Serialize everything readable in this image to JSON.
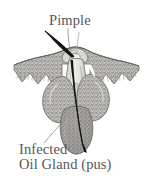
{
  "figure": {
    "type": "anatomical-cross-section",
    "background_color": "#ffffff",
    "labels": {
      "pimple": "Pimple",
      "infected": "Infected",
      "oil_gland": "Oil Gland (pus)"
    },
    "label_color": "#565656",
    "parts": [
      {
        "name": "skin-layer",
        "description": "Stippled epidermis band spanning the width with a scalloped lower edge",
        "fill_color": "#b4b4b4",
        "stroke_color": "#6f6f6f"
      },
      {
        "name": "hair-shaft",
        "description": "Dark hair emerging from pore, angled up-left above skin",
        "fill_color": "#1c1c1c"
      },
      {
        "name": "hair-root",
        "description": "Dark hair root descending through follicle into the infected gland",
        "fill_color": "#1c1c1c"
      },
      {
        "name": "follicle-duct",
        "description": "Pale central follicle canal from pore down to the gland",
        "fill_color": "#e8e6e2",
        "stroke_color": "#7a7a7a"
      },
      {
        "name": "sebaceous-lobe-left",
        "description": "Left stippled oil gland lobe",
        "fill_color": "#b6b6b6",
        "stroke_color": "#6f6f6f"
      },
      {
        "name": "sebaceous-lobe-right",
        "description": "Right stippled oil gland lobe",
        "fill_color": "#b6b6b6",
        "stroke_color": "#6f6f6f"
      },
      {
        "name": "infected-oil-gland",
        "description": "Lower darker gray sac filled with pus",
        "fill_color": "#9a9a9a",
        "stroke_color": "#6a6a6a"
      },
      {
        "name": "pore-bump",
        "description": "Raised pimple bump at the skin surface around the pore",
        "fill_color": "#d5d3cf",
        "stroke_color": "#6f6f6f"
      }
    ],
    "leader_lines": [
      {
        "name": "pimple-leader",
        "from": "Pimple label",
        "to": "pore bump at skin surface"
      },
      {
        "name": "infected-leader",
        "from": "Infected label",
        "to": "infected oil gland sac"
      }
    ]
  }
}
